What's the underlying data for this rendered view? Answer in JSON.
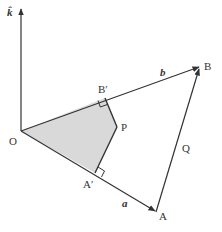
{
  "diagram": {
    "colors": {
      "line": "#333333",
      "shade": "#d9d9d9",
      "background": "#ffffff"
    },
    "points": {
      "O": {
        "x": 21,
        "y": 131
      },
      "A": {
        "x": 156,
        "y": 212
      },
      "B": {
        "x": 200,
        "y": 67
      },
      "A_prime": {
        "x": 95,
        "y": 173
      },
      "B_prime": {
        "x": 105,
        "y": 98
      },
      "P": {
        "x": 117,
        "y": 127
      },
      "k_tip": {
        "x": 21,
        "y": 8
      }
    },
    "labels": {
      "k": "k̂",
      "O": "O",
      "A": "A",
      "B": "B",
      "A_prime": "A′",
      "B_prime": "B′",
      "P": "P",
      "Q": "Q",
      "a": "a",
      "b": "b"
    }
  }
}
